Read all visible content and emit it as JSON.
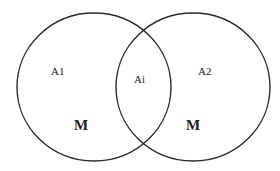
{
  "diagram": {
    "type": "venn",
    "stroke_color": "#2a2a2a",
    "background": "#ffffff",
    "sets": [
      {
        "id": "left",
        "label": "A1",
        "sublabel": "M"
      },
      {
        "id": "right",
        "label": "A2",
        "sublabel": "M"
      }
    ],
    "intersection": {
      "label": "Ai"
    }
  }
}
